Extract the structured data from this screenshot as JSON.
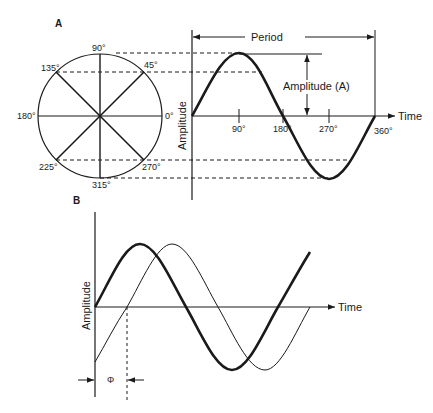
{
  "panel_a": {
    "label": "A",
    "circle_angles": [
      "0°",
      "45°",
      "90°",
      "135°",
      "180°",
      "225°",
      "270°",
      "315°"
    ],
    "period_label": "Period",
    "amplitude_label": "Amplitude (A)",
    "y_axis_label": "Amplitude",
    "x_axis_label": "Time",
    "x_ticks": [
      "90°",
      "180°",
      "270°",
      "360°"
    ]
  },
  "panel_b": {
    "label": "B",
    "y_axis_label": "Amplitude",
    "x_axis_label": "Time",
    "phase_label": "Φ"
  },
  "colors": {
    "ink": "#1a1a1a",
    "background": "#ffffff"
  }
}
